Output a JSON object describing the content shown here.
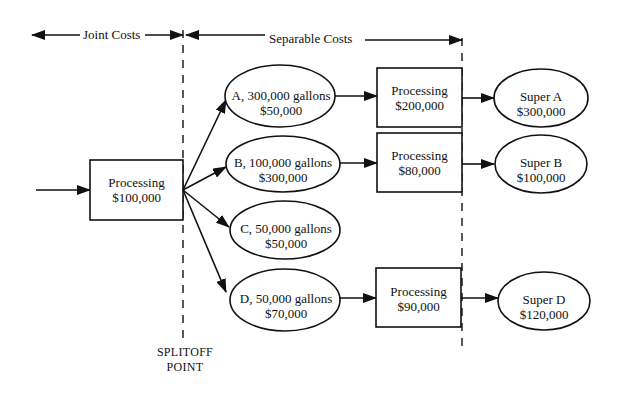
{
  "header": {
    "joint_costs": "Joint Costs",
    "separable_costs": "Separable Costs"
  },
  "joint_process": {
    "label": "Processing",
    "cost": "$100,000"
  },
  "splitoff": {
    "line1": "SPLITOFF",
    "line2": "POINT"
  },
  "products": [
    {
      "label": "A, 300,000 gallons",
      "value": "$50,000"
    },
    {
      "label": "B, 100,000 gallons",
      "value": "$300,000"
    },
    {
      "label": "C, 50,000 gallons",
      "value": "$50,000"
    },
    {
      "label": "D, 50,000 gallons",
      "value": "$70,000"
    }
  ],
  "separable_processing": [
    {
      "label": "Processing",
      "cost": "$200,000"
    },
    {
      "label": "Processing",
      "cost": "$80,000"
    },
    {
      "label": "Processing",
      "cost": "$90,000"
    }
  ],
  "final_products": [
    {
      "label": "Super A",
      "value": "$300,000"
    },
    {
      "label": "Super B",
      "value": "$100,000"
    },
    {
      "label": "Super D",
      "value": "$120,000"
    }
  ],
  "colors": {
    "stroke": "#111111",
    "background": "#ffffff"
  }
}
